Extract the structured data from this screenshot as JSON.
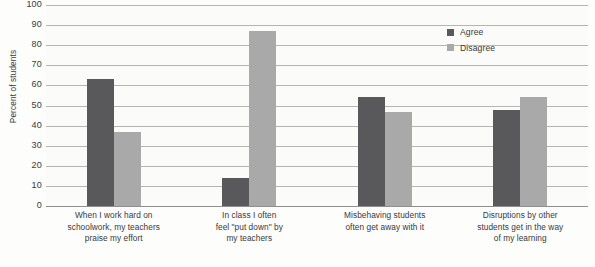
{
  "chart_data": {
    "type": "bar",
    "title": "",
    "xlabel": "",
    "ylabel": "Percent of students",
    "ylim": [
      0,
      100
    ],
    "ytick_step": 10,
    "yticks": [
      100,
      90,
      80,
      70,
      60,
      50,
      40,
      30,
      20,
      10,
      0
    ],
    "grid": true,
    "legend_position": "top-right",
    "categories": [
      "When I work hard on schoolwork, my teachers praise my effort",
      "In class I often feel \"put down\" by my teachers",
      "Misbehaving students often get away with it",
      "Disruptions by other students get in the way of my learning"
    ],
    "category_lines": [
      [
        "When I work hard on",
        "schoolwork, my teachers",
        "praise my effort"
      ],
      [
        "In class I often",
        "feel \"put down\" by",
        "my teachers"
      ],
      [
        "Misbehaving students",
        "often get away with it"
      ],
      [
        "Disruptions by other",
        "students get in the way",
        "of my learning"
      ]
    ],
    "series": [
      {
        "name": "Agree",
        "color": "#59595b",
        "values": [
          63,
          14,
          54,
          48
        ]
      },
      {
        "name": "Disagree",
        "color": "#a9a9a9",
        "values": [
          37,
          87,
          47,
          54
        ]
      }
    ]
  },
  "legend": {
    "items": [
      {
        "label": "Agree",
        "color": "#59595b"
      },
      {
        "label": "Disagree",
        "color": "#a9a9a9"
      }
    ]
  },
  "footnote": {
    "text": ""
  }
}
